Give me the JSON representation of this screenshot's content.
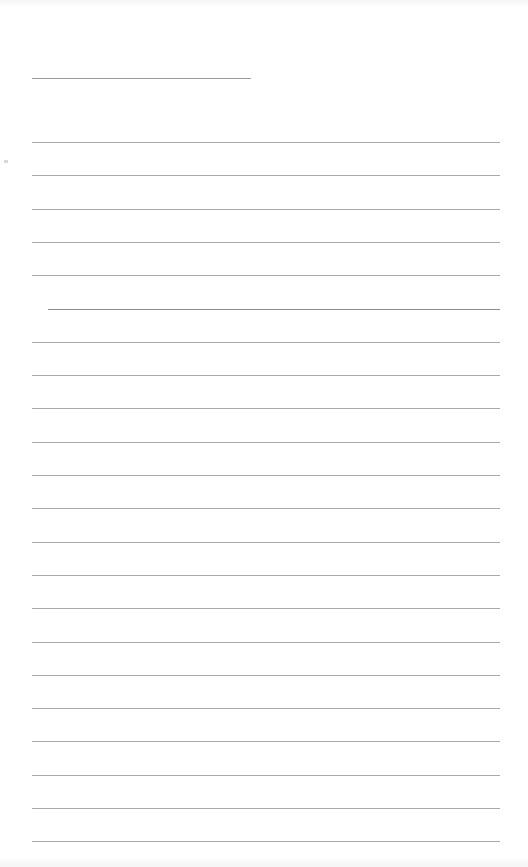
{
  "document": {
    "type": "blank lined sheet",
    "header_line": {
      "x1": 32,
      "x2": 251,
      "y": 78
    },
    "rule_lines": {
      "x1": 32,
      "x2": 500,
      "first_y": 142,
      "spacing": 33.3,
      "count": 22
    },
    "colors": {
      "background": "#ffffff",
      "line": "#a8a8a8",
      "header_line": "#9a9a9a"
    }
  }
}
